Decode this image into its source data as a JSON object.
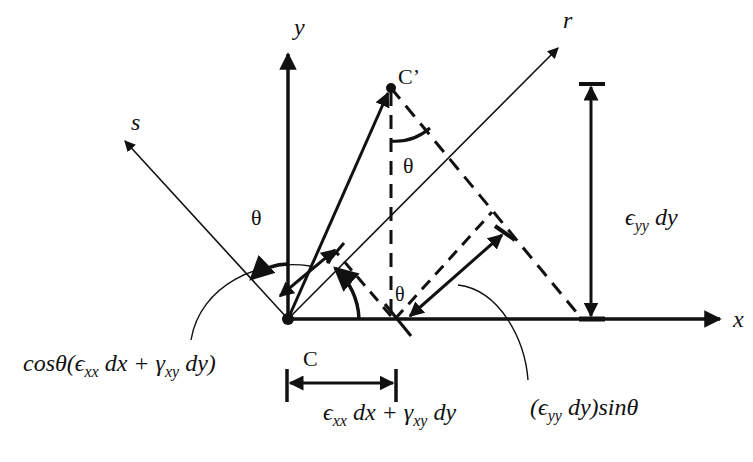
{
  "diagram": {
    "axes": {
      "x": "x",
      "y": "y",
      "r": "r",
      "s": "s"
    },
    "points": {
      "origin_label": "C",
      "displaced_label": "C’"
    },
    "angles": {
      "theta_y_s": "θ",
      "theta_at_c_prime": "θ",
      "theta_at_base": "θ"
    },
    "dimensions": {
      "horizontal": {
        "parts": [
          "ϵ",
          "xx",
          " dx + γ",
          "xy",
          " dy"
        ]
      },
      "vertical": {
        "parts": [
          "ϵ",
          "yy",
          " dy"
        ]
      }
    },
    "annotations": {
      "cos_term": {
        "parts": [
          "cosθ(ϵ",
          "xx",
          " dx + γ",
          "xy",
          " dy)"
        ]
      },
      "sin_term": {
        "parts": [
          "(ϵ",
          "yy",
          " dy)sinθ"
        ]
      }
    },
    "colors": {
      "stroke": "#111111",
      "background": "#ffffff"
    }
  }
}
